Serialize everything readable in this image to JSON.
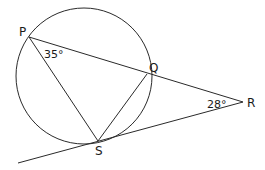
{
  "diagram": {
    "type": "circle-geometry",
    "circle": {
      "cx": 84,
      "cy": 76,
      "r": 68
    },
    "points": {
      "P": {
        "label": "P",
        "x": 29,
        "y": 37
      },
      "Q": {
        "label": "Q",
        "x": 147,
        "y": 74
      },
      "R": {
        "label": "R",
        "x": 243,
        "y": 102
      },
      "S": {
        "label": "S",
        "x": 98,
        "y": 141
      }
    },
    "segments": [
      {
        "from": "P",
        "to": "R",
        "name": "line-PQR"
      },
      {
        "from": "P",
        "to": "S",
        "name": "chord-PS"
      },
      {
        "from": "Q",
        "to": "S",
        "name": "chord-QS"
      },
      {
        "from": "R",
        "to": "tangent-end",
        "name": "tangent-RS"
      }
    ],
    "tangent_end": {
      "x": 18,
      "y": 163
    },
    "angles": {
      "P": {
        "label": "35°",
        "value": 35,
        "vertex": "P"
      },
      "R": {
        "label": "28°",
        "value": 28,
        "vertex": "R"
      }
    },
    "stroke_color": "#2a2a2a"
  }
}
